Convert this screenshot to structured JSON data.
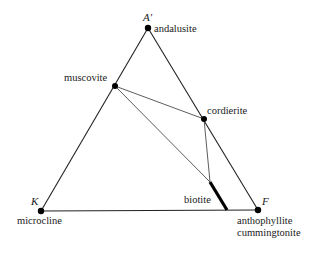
{
  "diagram": {
    "type": "ternary-phase-diagram",
    "colors": {
      "line": "#222222",
      "text": "#1a1a1a",
      "background": "#ffffff"
    },
    "vertices": {
      "A": {
        "label": "A′",
        "mineral": "andalusite",
        "x": 148,
        "y": 28
      },
      "K": {
        "label": "K",
        "mineral": "microcline",
        "x": 41,
        "y": 211
      },
      "F": {
        "label": "F",
        "mineral": "anthophyllite",
        "mineral2": "cummingtonite",
        "x": 258,
        "y": 210
      }
    },
    "phases": {
      "muscovite": {
        "label": "muscovite",
        "x": 115,
        "y": 86
      },
      "cordierite": {
        "label": "cordierite",
        "x": 204,
        "y": 119
      },
      "biotite": {
        "label": "biotite",
        "x1": 210,
        "y1": 182,
        "x2": 227,
        "y2": 210
      }
    },
    "tie_lines": [
      {
        "from": "muscovite",
        "to": "cordierite"
      },
      {
        "from": "muscovite",
        "to": "biotite-top"
      },
      {
        "from": "cordierite",
        "to": "biotite-top"
      }
    ]
  }
}
